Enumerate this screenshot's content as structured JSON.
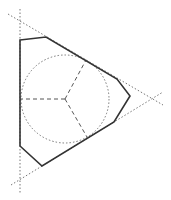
{
  "diagram": {
    "colors": {
      "background": "#ffffff",
      "polygon_stroke": "#333333",
      "guide_stroke": "#777777",
      "radius_stroke": "#555555"
    },
    "triangle_lines": [
      {
        "name": "left-side",
        "x1": 20,
        "y1": 9,
        "x2": 20,
        "y2": 193
      },
      {
        "name": "upper-side",
        "x1": 8,
        "y1": 14,
        "x2": 163,
        "y2": 105
      },
      {
        "name": "lower-side",
        "x1": 11,
        "y1": 185,
        "x2": 163,
        "y2": 92
      }
    ],
    "incircle": {
      "cx": 65,
      "cy": 99,
      "r": 44
    },
    "polygon_points": [
      [
        20,
        40
      ],
      [
        46,
        37
      ],
      [
        117,
        79
      ],
      [
        130,
        96
      ],
      [
        114,
        122
      ],
      [
        42,
        166
      ],
      [
        20,
        146
      ]
    ],
    "radii": [
      {
        "x1": 65,
        "y1": 99,
        "x2": 20,
        "y2": 99
      },
      {
        "x1": 65,
        "y1": 99,
        "x2": 86,
        "y2": 60
      },
      {
        "x1": 65,
        "y1": 99,
        "x2": 87,
        "y2": 137
      }
    ]
  }
}
